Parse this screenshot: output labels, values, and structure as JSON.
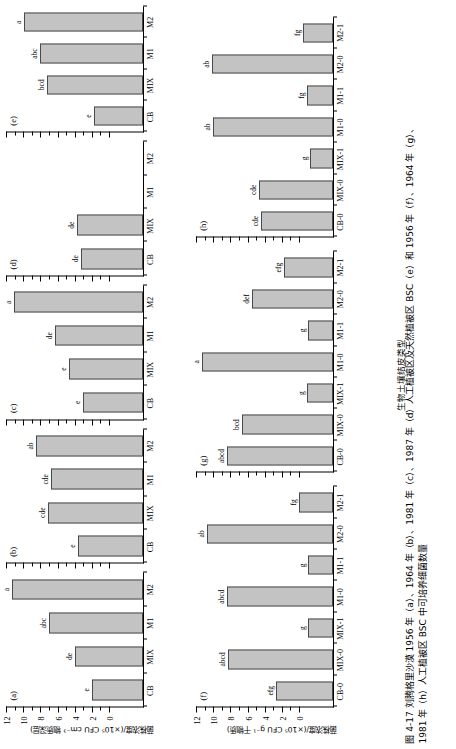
{
  "figure": {
    "caption_line1": "图 4-17  刘腾格里沙漠 1956 年（a）、1964 年（b）、1981 年（c）、1987 年（d）人工植被区及天然植被区 BSC（e）和 1956 年（f）、1964 年（g）、",
    "caption_line2": "1981 年（h）人工植被区 BSC 中可培养细菌数量",
    "xaxis_title": "生物土壤结皮类型",
    "yaxis_title_top": "菌株浓度/(×10⁵ CFU cm⁻³ 物质深层)",
    "yaxis_title_bottom": "菌株浓度/(×10⁵ CFU g⁻¹ 干物质)",
    "y_ticks": [
      "0",
      "2",
      "4",
      "6",
      "8",
      "10",
      "12"
    ],
    "y_min": 0,
    "y_max": 12,
    "bar_fill": "#c3c3c3",
    "bar_stroke": "#4a4a4a",
    "axis_color": "#000000"
  },
  "chart_data": [
    {
      "type": "bar",
      "panel": "(a)",
      "title": "",
      "xlabel": "生物土壤结皮类型",
      "ylabel": "菌株浓度/(×10⁵ CFU cm⁻³ 物质深层)",
      "ylim": [
        0,
        12
      ],
      "grid": false,
      "categories": [
        "CB",
        "MIX",
        "M1",
        "M2"
      ],
      "values": [
        4.5,
        6.0,
        8.2,
        11.5
      ],
      "annotations": [
        "e",
        "de",
        "abc",
        "a"
      ]
    },
    {
      "type": "bar",
      "panel": "(b)",
      "title": "",
      "xlabel": "生物土壤结皮类型",
      "ylabel": "菌株浓度/(×10⁵ CFU cm⁻³ 物质深层)",
      "ylim": [
        0,
        12
      ],
      "grid": false,
      "categories": [
        "CB",
        "MIX",
        "M1",
        "M2"
      ],
      "values": [
        5.7,
        8.3,
        8.1,
        9.4
      ],
      "annotations": [
        "e",
        "cde",
        "cde",
        "ab"
      ]
    },
    {
      "type": "bar",
      "panel": "(c)",
      "title": "",
      "xlabel": "生物土壤结皮类型",
      "ylabel": "菌株浓度/(×10⁵ CFU cm⁻³ 物质深层)",
      "ylim": [
        0,
        12
      ],
      "grid": false,
      "categories": [
        "CB",
        "MIX",
        "M1",
        "M2"
      ],
      "values": [
        5.3,
        6.5,
        7.7,
        11.3
      ],
      "annotations": [
        "e",
        "e",
        "de",
        "a"
      ]
    },
    {
      "type": "bar",
      "panel": "(d)",
      "title": "",
      "xlabel": "生物土壤结皮类型",
      "ylabel": "菌株浓度/(×10⁵ CFU cm⁻³ 物质深层)",
      "ylim": [
        0,
        12
      ],
      "grid": false,
      "categories": [
        "CB",
        "MIX",
        "M1",
        "M2"
      ],
      "values": [
        5.4,
        5.8,
        0,
        0
      ],
      "annotations": [
        "de",
        "de",
        "",
        ""
      ]
    },
    {
      "type": "bar",
      "panel": "(e)",
      "title": "",
      "xlabel": "生物土壤结皮类型",
      "ylabel": "菌株浓度/(×10⁵ CFU cm⁻³ 物质深层)",
      "ylim": [
        0,
        12
      ],
      "grid": false,
      "categories": [
        "CB",
        "MIX",
        "M1",
        "M2"
      ],
      "values": [
        4.3,
        8.4,
        9.0,
        10.4
      ],
      "annotations": [
        "e",
        "bcd",
        "abc",
        "a"
      ]
    },
    {
      "type": "bar",
      "panel": "(f)",
      "title": "",
      "xlabel": "生物土壤结皮类型",
      "ylabel": "菌株浓度/(×10⁵ CFU g⁻¹ 干物质)",
      "ylim": [
        0,
        12
      ],
      "grid": false,
      "categories": [
        "CB-0",
        "MIX-0",
        "MIX-1",
        "M1-0",
        "M1-1",
        "M2-0",
        "M2-1"
      ],
      "values": [
        5.0,
        9.2,
        2.2,
        9.3,
        2.2,
        11.0,
        3.0
      ],
      "annotations": [
        "efg",
        "abcd",
        "g",
        "abcd",
        "g",
        "ab",
        "fg"
      ]
    },
    {
      "type": "bar",
      "panel": "(g)",
      "title": "",
      "xlabel": "生物土壤结皮类型",
      "ylabel": "菌株浓度/(×10⁵ CFU g⁻¹ 干物质)",
      "ylim": [
        0,
        12
      ],
      "grid": false,
      "categories": [
        "CB-0",
        "MIX-0",
        "MIX-1",
        "M1-0",
        "M1-1",
        "M2-0",
        "M2-1"
      ],
      "values": [
        9.3,
        8.0,
        2.3,
        11.5,
        2.2,
        7.1,
        4.3
      ],
      "annotations": [
        "abcd",
        "bcd",
        "g",
        "a",
        "g",
        "def",
        "efg"
      ]
    },
    {
      "type": "bar",
      "panel": "(h)",
      "title": "",
      "xlabel": "生物土壤结皮类型",
      "ylabel": "菌株浓度/(×10⁵ CFU g⁻¹ 干物质)",
      "ylim": [
        0,
        12
      ],
      "grid": false,
      "categories": [
        "CB-0",
        "MIX-0",
        "MIX-1",
        "M1-0",
        "M1-1",
        "M2-0",
        "M2-1"
      ],
      "values": [
        6.3,
        6.5,
        2.0,
        10.5,
        2.3,
        10.6,
        2.6
      ],
      "annotations": [
        "cde",
        "cde",
        "g",
        "ab",
        "fg",
        "ab",
        "fg"
      ]
    }
  ]
}
